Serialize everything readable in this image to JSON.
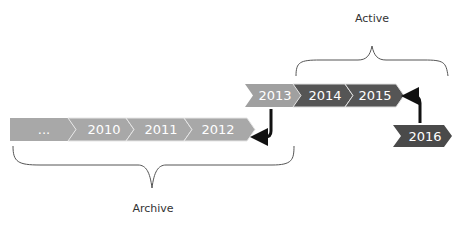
{
  "diagram": {
    "groups": {
      "active": {
        "label": "Active"
      },
      "archive": {
        "label": "Archive"
      }
    },
    "archive_row": [
      {
        "label": "...",
        "color": "#a8a8a8"
      },
      {
        "label": "2010",
        "color": "#a8a8a8"
      },
      {
        "label": "2011",
        "color": "#a8a8a8"
      },
      {
        "label": "2012",
        "color": "#a8a8a8"
      }
    ],
    "active_row": [
      {
        "label": "2013",
        "color": "#a0a0a0"
      },
      {
        "label": "2014",
        "color": "#555555"
      },
      {
        "label": "2015",
        "color": "#555555"
      }
    ],
    "incoming": {
      "label": "2016",
      "color": "#4a4a4a"
    },
    "arrows": [
      {
        "from": "2013",
        "to": "2012",
        "meaning": "2013 moves to archive"
      },
      {
        "from": "2016",
        "to": "2015",
        "meaning": "2016 joins active"
      }
    ],
    "colors": {
      "arrow": "#111111",
      "brace": "#555555"
    }
  }
}
